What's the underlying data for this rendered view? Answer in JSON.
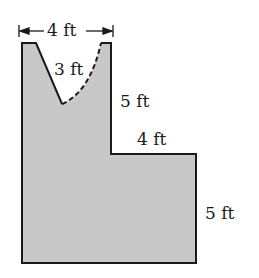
{
  "figure": {
    "fill_color": "#c8c8c8",
    "stroke_color": "#1a1a1a",
    "labels": {
      "top_width": "4 ft",
      "notch_side": "3 ft",
      "upper_right_height": "5 ft",
      "step_width": "4 ft",
      "lower_right_height": "5 ft"
    }
  }
}
